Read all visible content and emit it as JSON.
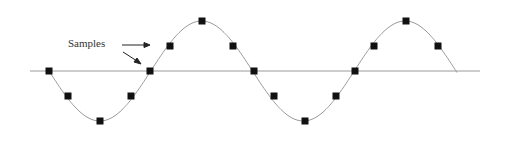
{
  "diagram": {
    "annotation": "Samples",
    "axis_y": 71,
    "axis_x_range": [
      30,
      480
    ],
    "curve_color": "#9a9a9a",
    "axis_color": "#9a9a9a",
    "marker_color": "#111111",
    "samples": [
      [
        49,
        71
      ],
      [
        68,
        96
      ],
      [
        100,
        121
      ],
      [
        131,
        96
      ],
      [
        150,
        71
      ],
      [
        170,
        46
      ],
      [
        202,
        21
      ],
      [
        233,
        46
      ],
      [
        254,
        71
      ],
      [
        274,
        96
      ],
      [
        305,
        121
      ],
      [
        336,
        96
      ],
      [
        355,
        71
      ],
      [
        374,
        46
      ],
      [
        406,
        21
      ],
      [
        438,
        46
      ]
    ],
    "curve_end": [
      457,
      71
    ]
  }
}
